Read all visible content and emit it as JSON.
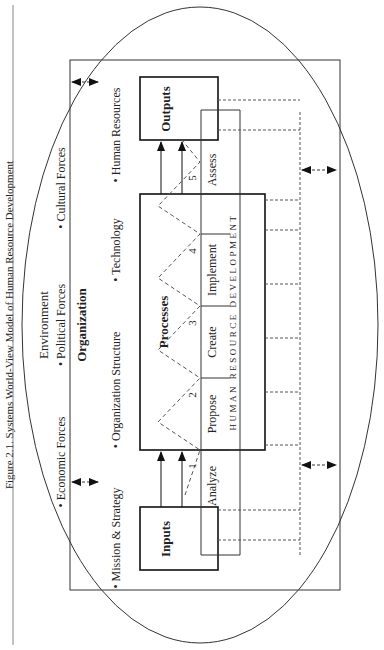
{
  "caption": "Figure 2.1.  Systems World-View Model of Human Resource Development",
  "environment": {
    "title": "Environment",
    "forces": [
      "• Economic Forces",
      "• Political Forces",
      "• Cultural Forces"
    ]
  },
  "organization": {
    "title": "Organization",
    "items": [
      "• Mission & Strategy",
      "• Organization Structure",
      "• Technology",
      "• Human Resources"
    ]
  },
  "system": {
    "inputs": "Inputs",
    "processes": "Processes",
    "outputs": "Outputs"
  },
  "hrd": {
    "label": "HUMAN RESOURCE DEVELOPMENT",
    "phases": [
      {
        "num": "1",
        "name": "Analyze"
      },
      {
        "num": "2",
        "name": "Propose"
      },
      {
        "num": "3",
        "name": "Create"
      },
      {
        "num": "4",
        "name": "Implement"
      },
      {
        "num": "5",
        "name": "Assess"
      }
    ]
  },
  "colors": {
    "line": "#222222",
    "dash": "#555555",
    "rule": "#666666"
  }
}
